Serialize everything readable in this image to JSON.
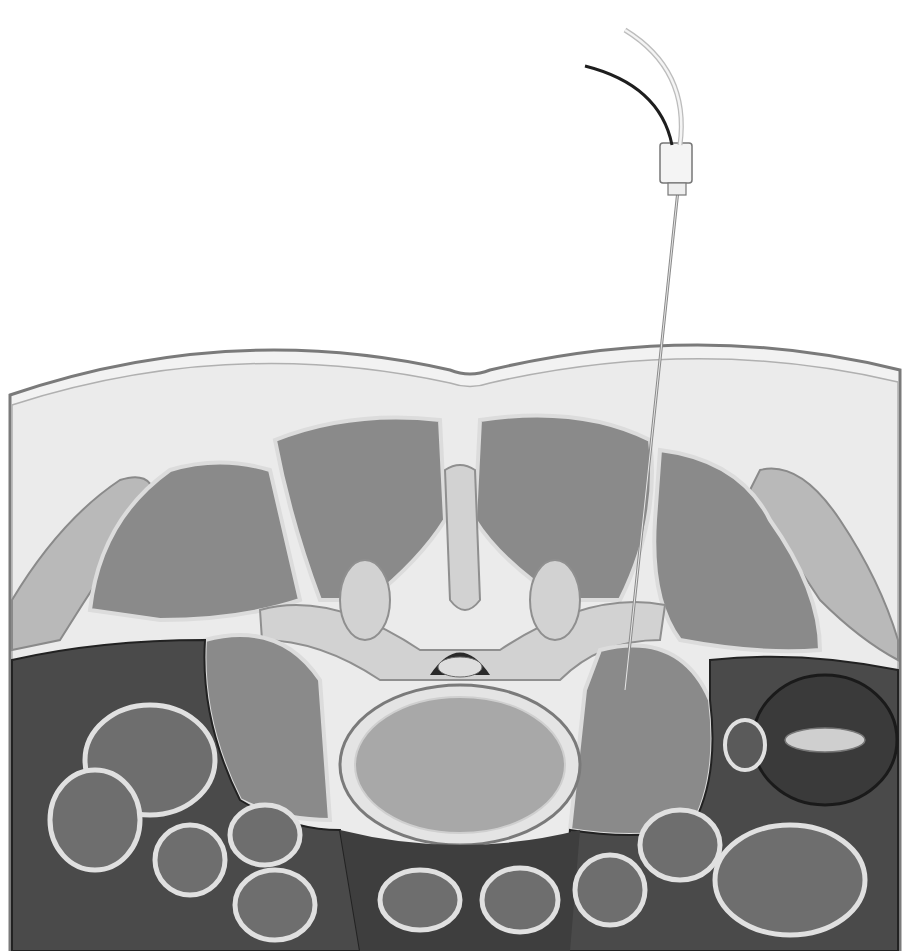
{
  "figure": {
    "colors": {
      "background": "#ffffff",
      "fat": "#ececec",
      "muscle": "#8a8a8a",
      "muscle_outline": "#d8d8d8",
      "bone": "#c9c9c9",
      "vertebral_body": "#a8a8a8",
      "cavity": "#3c3c3c",
      "bowel": "#6a6a6a",
      "kidney": "#4a4a4a",
      "needle": "#9a9a9a",
      "catheter_dark": "#222222"
    }
  }
}
